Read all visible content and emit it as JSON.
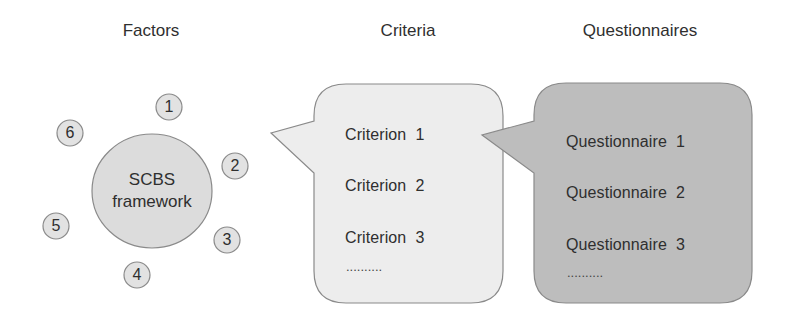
{
  "headings": {
    "factors": "Factors",
    "criteria": "Criteria",
    "questionnaires": "Questionnaires"
  },
  "framework": {
    "line1": "SCBS",
    "line2": "framework",
    "factors": [
      "1",
      "2",
      "3",
      "4",
      "5",
      "6"
    ]
  },
  "criteria": {
    "items": [
      "Criterion  1",
      "Criterion  2",
      "Criterion  3"
    ],
    "ellipsis": ".........."
  },
  "questionnaires": {
    "items": [
      "Questionnaire  1",
      "Questionnaire  2",
      "Questionnaire  3"
    ],
    "ellipsis": ".........."
  },
  "colors": {
    "framework_fill": "#dcdcdc",
    "factor_fill": "#e2e2e2",
    "criteria_fill": "#ededed",
    "questionnaire_fill": "#bdbdbd",
    "stroke": "#8a8a8a"
  }
}
